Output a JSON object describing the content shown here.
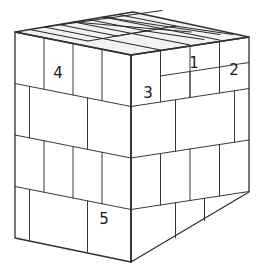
{
  "figure": {
    "background_color": "#ffffff",
    "line_color": "#303030",
    "top_face_fill": "#f2f2f2",
    "side_face_fill": "#ffffff"
  },
  "labels": [
    {
      "id": "label-1",
      "text": "1",
      "x": 194,
      "y": 63,
      "face": "right"
    },
    {
      "id": "label-2",
      "text": "2",
      "x": 234,
      "y": 70,
      "face": "right"
    },
    {
      "id": "label-3",
      "text": "3",
      "x": 148,
      "y": 93,
      "face": "left"
    },
    {
      "id": "label-4",
      "text": "4",
      "x": 58,
      "y": 73,
      "face": "left"
    },
    {
      "id": "label-5",
      "text": "5",
      "x": 104,
      "y": 219,
      "face": "left"
    }
  ],
  "geometry": {
    "vertices": {
      "front_top": [
        131,
        55
      ],
      "front_bottom": [
        131,
        262
      ],
      "left_top": [
        15,
        32
      ],
      "left_bottom": [
        15,
        238
      ],
      "right_top": [
        249,
        37
      ],
      "right_bottom": [
        249,
        192
      ],
      "back_top": [
        133,
        12
      ]
    },
    "faces": {
      "top": "15,32 133,12 249,37 131,55",
      "left": "15,32 131,55 131,262 15,238",
      "right": "131,55 249,37 249,192 131,262"
    },
    "rows": 4,
    "columns": 4,
    "note": "blocks staggered in a running-bond brick pattern on each visible face"
  }
}
